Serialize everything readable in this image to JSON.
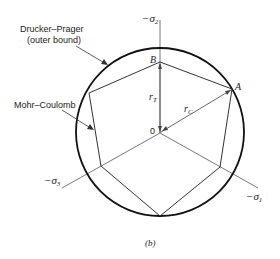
{
  "diagram": {
    "caption": "(b)",
    "labels": {
      "drucker_prager_line1": "Drucker–Prager",
      "drucker_prager_line2": "(outer bound)",
      "mohr_coulomb": "Mohr–Coulomb",
      "point_a": "A",
      "point_b": "B",
      "origin": "0",
      "r_t": "r",
      "r_t_sub": "T",
      "r_c": "r",
      "r_c_sub": "C"
    },
    "axes": [
      {
        "name": "-σ2",
        "prefix": "−σ",
        "sub": "2",
        "direction": "up"
      },
      {
        "name": "-σ3",
        "prefix": "−σ",
        "sub": "3",
        "direction": "lower-left"
      },
      {
        "name": "-σ1",
        "prefix": "−σ",
        "sub": "1",
        "direction": "lower-right"
      }
    ],
    "shapes": {
      "outer_circle": "Drucker–Prager (outer bound)",
      "inner_hexagon": "Mohr–Coulomb"
    }
  }
}
